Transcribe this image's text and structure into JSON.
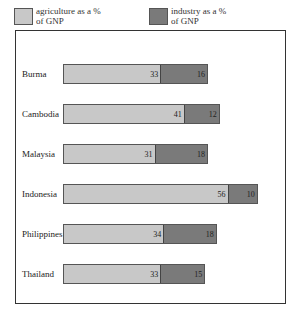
{
  "legend": {
    "items": [
      {
        "label": "agriculture as a % of GNP",
        "color": "#c8c8c8"
      },
      {
        "label": "industry as a % of GNP",
        "color": "#7a7a7a"
      }
    ]
  },
  "chart_data": {
    "type": "bar",
    "orientation": "horizontal",
    "stacked": true,
    "title": "",
    "xlabel": "",
    "ylabel": "",
    "categories": [
      "Burma",
      "Cambodia",
      "Malaysia",
      "Indonesia",
      "Philippines",
      "Thailand"
    ],
    "series": [
      {
        "name": "agriculture as a % of GNP",
        "color": "#c8c8c8",
        "values": [
          33,
          41,
          31,
          56,
          34,
          33
        ]
      },
      {
        "name": "industry as a % of GNP",
        "color": "#7a7a7a",
        "values": [
          16,
          12,
          18,
          10,
          18,
          15
        ]
      }
    ],
    "legend_position": "top",
    "grid": false,
    "data_labels": true
  },
  "rows": [
    {
      "country": "Burma",
      "agri": "33",
      "ind": "16"
    },
    {
      "country": "Cambodia",
      "agri": "41",
      "ind": "12"
    },
    {
      "country": "Malaysia",
      "agri": "31",
      "ind": "18"
    },
    {
      "country": "Indonesia",
      "agri": "56",
      "ind": "10"
    },
    {
      "country": "Philippines",
      "agri": "34",
      "ind": "18"
    },
    {
      "country": "Thailand",
      "agri": "33",
      "ind": "15"
    }
  ]
}
